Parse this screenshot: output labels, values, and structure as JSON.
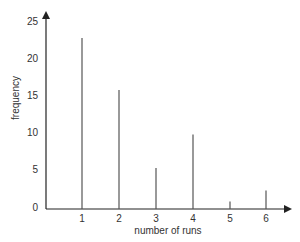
{
  "chart_data": {
    "type": "bar",
    "title": "",
    "xlabel": "number of runs",
    "ylabel": "frequency",
    "categories": [
      "1",
      "2",
      "3",
      "4",
      "5",
      "6"
    ],
    "values": [
      23,
      16,
      5.5,
      10,
      1,
      2.5
    ],
    "yticks": [
      "0",
      "5",
      "10",
      "15",
      "20",
      "25"
    ],
    "ylim": [
      0,
      26
    ],
    "grid": false,
    "legend": null,
    "style": "spike (vertical line) bar chart with arrowed axes"
  },
  "colors": {
    "axis": "#222222",
    "bars": "#555555",
    "text": "#333333"
  }
}
